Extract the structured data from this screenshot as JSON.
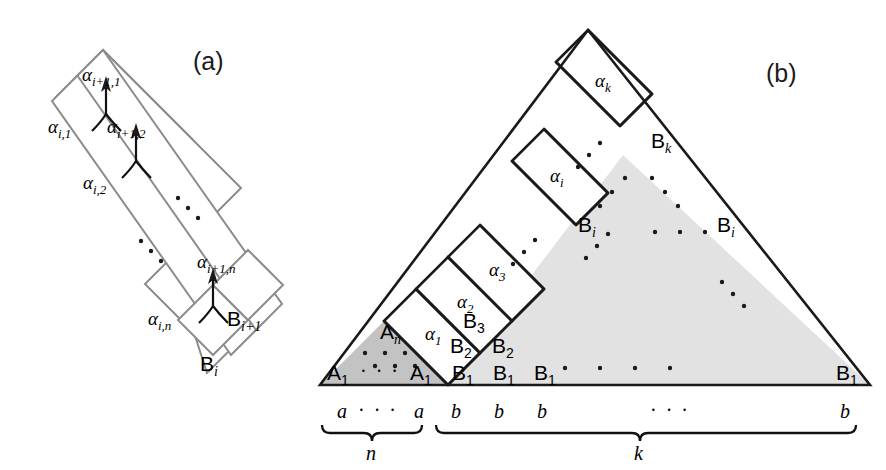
{
  "figure": {
    "panel_a_label": "(a)",
    "panel_b_label": "(b)"
  },
  "panel_a": {
    "alpha_labels": [
      {
        "base": "α",
        "sub": "i+1,1"
      },
      {
        "base": "α",
        "sub": "i,1"
      },
      {
        "base": "α",
        "sub": "i+1,2"
      },
      {
        "base": "α",
        "sub": "i,2"
      },
      {
        "base": "α",
        "sub": "i+1,n"
      },
      {
        "base": "α",
        "sub": "i,n"
      }
    ],
    "b_labels": [
      {
        "base": "B",
        "sub": "i+1"
      },
      {
        "base": "B",
        "sub": "i"
      }
    ],
    "ellipsis_count": 2
  },
  "panel_b": {
    "alpha_labels": [
      {
        "base": "α",
        "sub": "1"
      },
      {
        "base": "α",
        "sub": "2"
      },
      {
        "base": "α",
        "sub": "3"
      },
      {
        "base": "α",
        "sub": "i"
      },
      {
        "base": "α",
        "sub": "k"
      }
    ],
    "a_labels": [
      {
        "base": "A",
        "sub": "n"
      },
      {
        "base": "A",
        "sub": "1"
      },
      {
        "base": "A",
        "sub": "1"
      }
    ],
    "b_labels": [
      {
        "base": "B",
        "sub": "1"
      },
      {
        "base": "B",
        "sub": "1"
      },
      {
        "base": "B",
        "sub": "1"
      },
      {
        "base": "B",
        "sub": "1"
      },
      {
        "base": "B",
        "sub": "2"
      },
      {
        "base": "B",
        "sub": "2"
      },
      {
        "base": "B",
        "sub": "3"
      },
      {
        "base": "B",
        "sub": "i"
      },
      {
        "base": "B",
        "sub": "i"
      },
      {
        "base": "B",
        "sub": "k"
      }
    ],
    "a_ellipsis": "· · ·",
    "braces": [
      {
        "letters": [
          "a",
          "a"
        ],
        "ellipsis": "· · ·",
        "count_label": "n"
      },
      {
        "letters": [
          "b",
          "b",
          "b",
          "b"
        ],
        "ellipsis": "·   ·   ·",
        "count_label": "k"
      }
    ]
  },
  "colors": {
    "dark_shade": "#c3c3c3",
    "light_shade": "#e2e2e2",
    "gray_stroke": "#8c8c8c",
    "black_stroke": "#1a1a1a",
    "text": "#000000"
  }
}
